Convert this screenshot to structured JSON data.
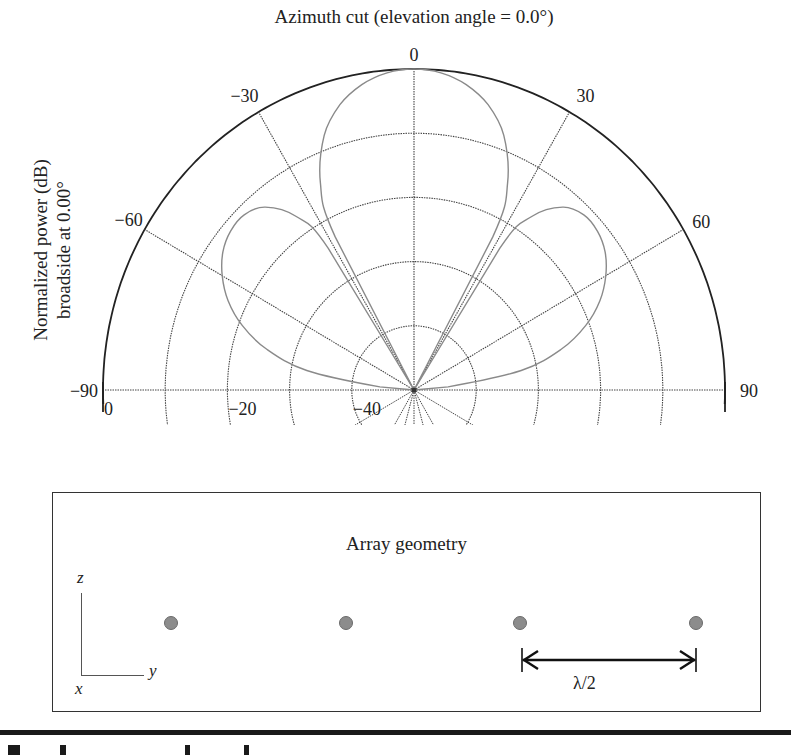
{
  "chart_data": {
    "type": "line",
    "subtype": "polar",
    "title": "Azimuth cut (elevation angle = 0.0°)",
    "ylabel_lines": [
      "Normalized power (dB)",
      "broadside at 0.00°"
    ],
    "xlabel": "",
    "angle_range_deg": [
      -90,
      90
    ],
    "angle_ticks": [
      -90,
      -60,
      -30,
      0,
      30,
      60,
      90
    ],
    "angle_tick_labels": [
      "−90",
      "−60",
      "−30",
      "0",
      "30",
      "60",
      "90"
    ],
    "radial_range_db": [
      -50,
      0
    ],
    "radial_rings_db": [
      0,
      -10,
      -20,
      -30,
      -40
    ],
    "radial_tick_labels": [
      {
        "value": 0,
        "label": "0"
      },
      {
        "value": -20,
        "label": "−20"
      },
      {
        "value": -40,
        "label": "−40"
      }
    ],
    "grid": true,
    "series": [
      {
        "name": "Array pattern",
        "color": "#8a8a8a",
        "angles_deg": [
          -90,
          -85,
          -80,
          -75,
          -70,
          -65,
          -60,
          -55,
          -50,
          -45,
          -40,
          -35,
          -32,
          -30,
          -28,
          -25,
          -20,
          -15,
          -10,
          -5,
          0,
          5,
          10,
          15,
          20,
          25,
          28,
          30,
          32,
          35,
          40,
          45,
          50,
          55,
          60,
          65,
          70,
          75,
          80,
          85,
          90
        ],
        "values_db": [
          -50,
          -44.5,
          -32.5,
          -25.5,
          -20.6,
          -17.0,
          -14.4,
          -12.5,
          -11.5,
          -11.4,
          -12.8,
          -17.0,
          -24.0,
          -50,
          -23.0,
          -14.4,
          -7.8,
          -4.0,
          -1.7,
          -0.4,
          0,
          -0.4,
          -1.7,
          -4.0,
          -7.8,
          -14.4,
          -23.0,
          -50,
          -24.0,
          -17.0,
          -12.8,
          -11.4,
          -11.5,
          -12.5,
          -14.4,
          -17.0,
          -20.6,
          -25.5,
          -32.5,
          -44.5,
          -50
        ]
      }
    ]
  },
  "geometry": {
    "title": "Array geometry",
    "axis_labels": {
      "z": "z",
      "y": "y",
      "x": "x"
    },
    "element_count": 4,
    "element_color": "#8c8c8c",
    "spacing_label": "λ/2"
  }
}
